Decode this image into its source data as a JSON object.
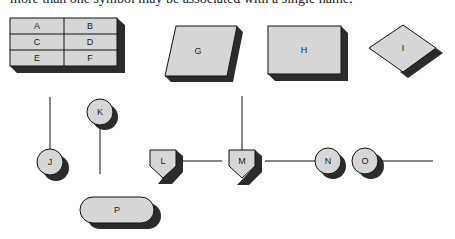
{
  "caption": "more than one symbol may be associated with a single name.",
  "colors": {
    "fill": "#d6d6d6",
    "shadow": "#2b2b2b",
    "stroke": "#111111",
    "line": "#111111"
  },
  "table": {
    "cells": [
      [
        "A",
        "B"
      ],
      [
        "C",
        "D"
      ],
      [
        "E",
        "F"
      ]
    ]
  },
  "symbols": {
    "G": "G",
    "H": "H",
    "I": "I",
    "J": "J",
    "K": "K",
    "L": "L",
    "M": "M",
    "N": "N",
    "O": "O",
    "P": "P"
  }
}
